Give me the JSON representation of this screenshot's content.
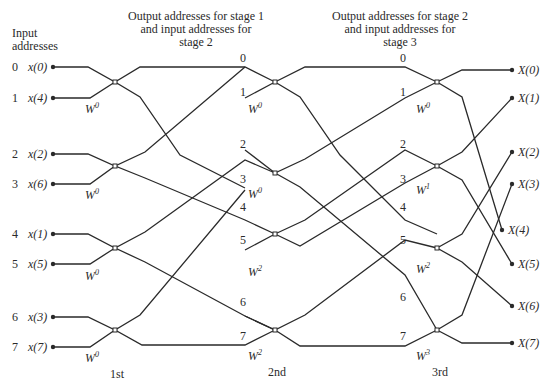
{
  "diagram": {
    "input_header": [
      "Input",
      "addresses"
    ],
    "stage1_header": [
      "Output addresses for stage 1",
      "and input addresses for",
      "stage 2"
    ],
    "stage2_header": [
      "Output addresses for stage 2",
      "and input addresses for",
      "stage 3"
    ],
    "inputs": [
      {
        "address": "0",
        "label": "x(0)"
      },
      {
        "address": "1",
        "label": "x(4)"
      },
      {
        "address": "2",
        "label": "x(2)"
      },
      {
        "address": "3",
        "label": "x(6)"
      },
      {
        "address": "4",
        "label": "x(1)"
      },
      {
        "address": "5",
        "label": "x(5)"
      },
      {
        "address": "6",
        "label": "x(3)"
      },
      {
        "address": "7",
        "label": "x(7)"
      }
    ],
    "outputs": [
      "X(0)",
      "X(1)",
      "X(2)",
      "X(3)",
      "X(4)",
      "X(5)",
      "X(6)",
      "X(7)"
    ],
    "stage1_addresses": [
      "0",
      "1",
      "2",
      "3",
      "4",
      "5",
      "6",
      "7"
    ],
    "stage2_addresses": [
      "0",
      "1",
      "2",
      "3",
      "4",
      "5",
      "6",
      "7"
    ],
    "twiddles": {
      "stage1": [
        "W",
        "W",
        "W",
        "W"
      ],
      "stage1_exp": [
        "0",
        "0",
        "0",
        "0"
      ],
      "stage2": [
        "W",
        "W",
        "W",
        "W"
      ],
      "stage2_exp": [
        "0",
        "0",
        "2",
        "2"
      ],
      "stage3": [
        "W",
        "W",
        "W",
        "W"
      ],
      "stage3_exp": [
        "0",
        "1",
        "2",
        "3"
      ]
    },
    "stage_labels": [
      "1st",
      "2nd",
      "3rd"
    ],
    "colors": {
      "ink": "#2a2a2a",
      "background": "#ffffff"
    }
  }
}
